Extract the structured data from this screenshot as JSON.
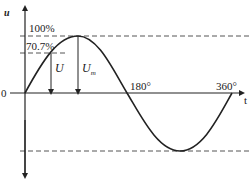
{
  "diagram": {
    "axis_labels": {
      "y": "u",
      "x": "t",
      "origin": "0"
    },
    "level_labels": {
      "peak": "100%",
      "rms": "70.7%"
    },
    "value_labels": {
      "rms_value": "U",
      "peak_value": "U",
      "peak_value_sub": "m"
    },
    "angle_labels": {
      "half": "180°",
      "full": "360°"
    },
    "colors": {
      "stroke": "#222222",
      "dashed": "#555555"
    }
  }
}
